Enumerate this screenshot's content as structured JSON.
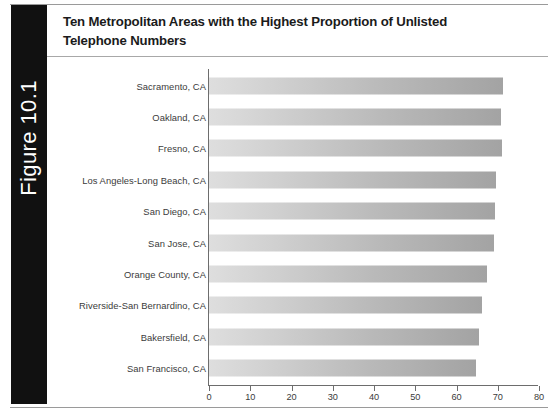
{
  "figure": {
    "tab_label": "Figure 10.1",
    "title": "Ten Metropolitan Areas with the Highest Proportion of Unlisted Telephone Numbers",
    "tab_color": "#111111",
    "bar_color_light": "#dedede",
    "bar_color_dark": "#a3a3a3",
    "axis_color": "#6d6d6d",
    "text_color": "#3b3b3b"
  },
  "chart_data": {
    "type": "bar",
    "orientation": "horizontal",
    "title": "Ten Metropolitan Areas with the Highest Proportion of Unlisted Telephone Numbers",
    "xlabel": "",
    "ylabel": "",
    "xlim": [
      0,
      80
    ],
    "xticks": [
      0,
      10,
      20,
      30,
      40,
      50,
      60,
      70,
      80
    ],
    "xtick_labels": [
      "0",
      "10",
      "20",
      "30",
      "40",
      "50",
      "60",
      "70",
      "80"
    ],
    "grid": false,
    "legend": false,
    "categories": [
      "Sacramento, CA",
      "Oakland, CA",
      "Fresno, CA",
      "Los Angeles-Long Beach, CA",
      "San Diego, CA",
      "San Jose, CA",
      "Orange County, CA",
      "Riverside-San Bernardino, CA",
      "Bakersfield, CA",
      "San Francisco, CA"
    ],
    "values": [
      71.2,
      70.8,
      71.1,
      69.6,
      69.3,
      69.2,
      67.3,
      66.1,
      65.4,
      64.8
    ]
  }
}
